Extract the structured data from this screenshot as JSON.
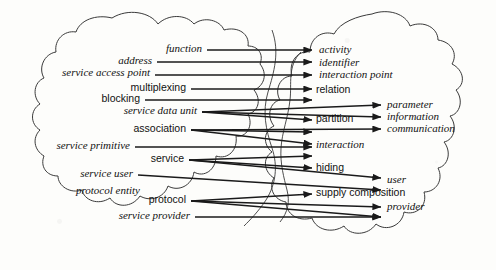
{
  "diagram": {
    "type": "mapping-diagram",
    "stroke_color": "#1a1a1a",
    "background_color": "#fdfdfb",
    "left_blob_name": "left-concept-cloud",
    "right_blob_name": "right-concept-cloud",
    "left_labels": [
      {
        "text": "function",
        "style": "italic",
        "x": 202,
        "y": 52,
        "anchor": "end"
      },
      {
        "text": "address",
        "style": "italic",
        "x": 152,
        "y": 64,
        "anchor": "end"
      },
      {
        "text": "service access point",
        "style": "italic",
        "x": 150,
        "y": 76,
        "anchor": "end"
      },
      {
        "text": "multiplexing",
        "style": "sans",
        "x": 186,
        "y": 91,
        "anchor": "end"
      },
      {
        "text": "blocking",
        "style": "sans",
        "x": 140,
        "y": 102,
        "anchor": "end"
      },
      {
        "text": "service data unit",
        "style": "italic",
        "x": 197,
        "y": 114,
        "anchor": "end"
      },
      {
        "text": "association",
        "style": "sans",
        "x": 186,
        "y": 132,
        "anchor": "end"
      },
      {
        "text": "service primitive",
        "style": "italic",
        "x": 130,
        "y": 149,
        "anchor": "end"
      },
      {
        "text": "service",
        "style": "sans",
        "x": 184,
        "y": 162,
        "anchor": "end"
      },
      {
        "text": "service user",
        "style": "italic",
        "x": 133,
        "y": 177,
        "anchor": "end"
      },
      {
        "text": "protocol entity",
        "style": "italic",
        "x": 140,
        "y": 194,
        "anchor": "end"
      },
      {
        "text": "protocol",
        "style": "sans",
        "x": 186,
        "y": 203,
        "anchor": "end"
      },
      {
        "text": "service provider",
        "style": "italic",
        "x": 190,
        "y": 219,
        "anchor": "end"
      }
    ],
    "right_labels": [
      {
        "text": "activity",
        "style": "italic",
        "x": 319,
        "y": 53,
        "column": 1
      },
      {
        "text": "identifier",
        "style": "italic",
        "x": 319,
        "y": 66,
        "column": 1
      },
      {
        "text": "interaction point",
        "style": "italic",
        "x": 319,
        "y": 78,
        "column": 1
      },
      {
        "text": "relation",
        "style": "sans",
        "x": 316,
        "y": 93,
        "column": 1
      },
      {
        "text": "parameter",
        "style": "italic",
        "x": 387,
        "y": 108,
        "column": 2
      },
      {
        "text": "partition",
        "style": "sans",
        "x": 316,
        "y": 122,
        "column": 1
      },
      {
        "text": "information",
        "style": "italic",
        "x": 387,
        "y": 120,
        "column": 2
      },
      {
        "text": "communication",
        "style": "italic",
        "x": 387,
        "y": 132,
        "column": 2
      },
      {
        "text": "interaction",
        "style": "italic",
        "x": 316,
        "y": 148,
        "column": 1
      },
      {
        "text": "hiding",
        "style": "sans",
        "x": 316,
        "y": 171,
        "column": 1
      },
      {
        "text": "user",
        "style": "italic",
        "x": 387,
        "y": 183,
        "column": 2
      },
      {
        "text": "supply composition",
        "style": "sans",
        "x": 316,
        "y": 196,
        "column": 1
      },
      {
        "text": "provider",
        "style": "italic",
        "x": 387,
        "y": 210,
        "column": 2
      }
    ],
    "arrow_targets_column1_x": 312,
    "arrow_targets_column2_x": 381,
    "edges": [
      {
        "from": "function",
        "to": "activity",
        "x1": 207,
        "y1": 50,
        "x2": 312,
        "y2": 50
      },
      {
        "from": "address",
        "to": "identifier",
        "x1": 157,
        "y1": 62,
        "x2": 312,
        "y2": 62
      },
      {
        "from": "service access point",
        "to": "interaction point",
        "x1": 155,
        "y1": 75,
        "x2": 312,
        "y2": 75
      },
      {
        "from": "multiplexing",
        "to": "relation",
        "x1": 191,
        "y1": 89,
        "x2": 312,
        "y2": 89
      },
      {
        "from": "blocking",
        "to": "relation-b",
        "x1": 145,
        "y1": 100,
        "x2": 312,
        "y2": 100
      },
      {
        "from": "service data unit",
        "to": "parameter",
        "x1": 202,
        "y1": 112,
        "x2": 381,
        "y2": 105
      },
      {
        "from": "service data unit",
        "to": "information",
        "x1": 202,
        "y1": 112,
        "x2": 381,
        "y2": 117
      },
      {
        "from": "service data unit",
        "to": "partition",
        "x1": 202,
        "y1": 112,
        "x2": 312,
        "y2": 120
      },
      {
        "from": "association",
        "to": "communication",
        "x1": 191,
        "y1": 130,
        "x2": 381,
        "y2": 129
      },
      {
        "from": "association",
        "to": "relation-c",
        "x1": 191,
        "y1": 130,
        "x2": 312,
        "y2": 132
      },
      {
        "from": "association",
        "to": "interaction-a",
        "x1": 191,
        "y1": 130,
        "x2": 312,
        "y2": 144
      },
      {
        "from": "service primitive",
        "to": "interaction-b",
        "x1": 135,
        "y1": 147,
        "x2": 312,
        "y2": 147
      },
      {
        "from": "service",
        "to": "interaction-c",
        "x1": 189,
        "y1": 160,
        "x2": 312,
        "y2": 156
      },
      {
        "from": "service",
        "to": "hiding",
        "x1": 189,
        "y1": 160,
        "x2": 312,
        "y2": 168
      },
      {
        "from": "service",
        "to": "user-a",
        "x1": 189,
        "y1": 160,
        "x2": 381,
        "y2": 178
      },
      {
        "from": "service user",
        "to": "user-b",
        "x1": 138,
        "y1": 175,
        "x2": 381,
        "y2": 190
      },
      {
        "from": "protocol",
        "to": "supply-composition",
        "x1": 191,
        "y1": 201,
        "x2": 312,
        "y2": 194
      },
      {
        "from": "protocol",
        "to": "provider-a",
        "x1": 191,
        "y1": 201,
        "x2": 381,
        "y2": 207
      },
      {
        "from": "protocol",
        "to": "provider-b",
        "x1": 191,
        "y1": 201,
        "x2": 381,
        "y2": 217
      },
      {
        "from": "service provider",
        "to": "provider-c",
        "x1": 195,
        "y1": 217,
        "x2": 381,
        "y2": 217
      }
    ]
  }
}
